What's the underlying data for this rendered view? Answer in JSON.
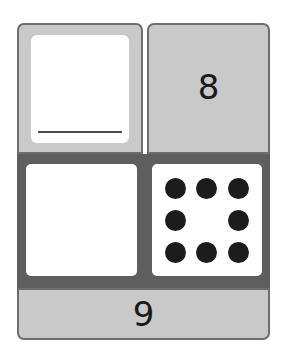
{
  "worksheet": {
    "top_left": {
      "label": "",
      "answer_line": true
    },
    "top_right": {
      "number": "8"
    },
    "bottom_left": {
      "content": ""
    },
    "bottom_right": {
      "dot_count": 8,
      "dots": [
        true,
        true,
        true,
        true,
        false,
        true,
        true,
        true,
        true
      ]
    },
    "bottom_strip": {
      "number": "9"
    }
  },
  "colors": {
    "light_cell": "#c9c9c9",
    "dark_band": "#5e5e5e",
    "border": "#6d6d6d",
    "dot": "#1c1c1c"
  }
}
